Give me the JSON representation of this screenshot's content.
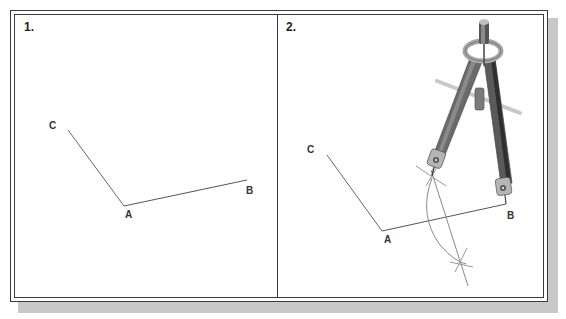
{
  "figure": {
    "panels": [
      {
        "label": "1.",
        "points": {
          "A": {
            "label": "A",
            "x": 124,
            "y": 206
          },
          "B": {
            "label": "B",
            "x": 247,
            "y": 180
          },
          "C": {
            "label": "C",
            "x": 68,
            "y": 130
          }
        }
      },
      {
        "label": "2.",
        "points": {
          "A": {
            "label": "A",
            "x": 382,
            "y": 231
          },
          "B": {
            "label": "B",
            "x": 506,
            "y": 204
          },
          "C": {
            "label": "C",
            "x": 327,
            "y": 155
          }
        },
        "construction": {
          "arc_description": "compass arc crossing ray AB",
          "bisector_marks": 2,
          "tool": "compass-icon"
        }
      }
    ],
    "colors": {
      "line": "#555555",
      "frame": "#3a3a3a",
      "shadow": "#c8c8c8",
      "compass_dark": "#5a5a5a",
      "compass_light": "#b9b9b9"
    }
  }
}
